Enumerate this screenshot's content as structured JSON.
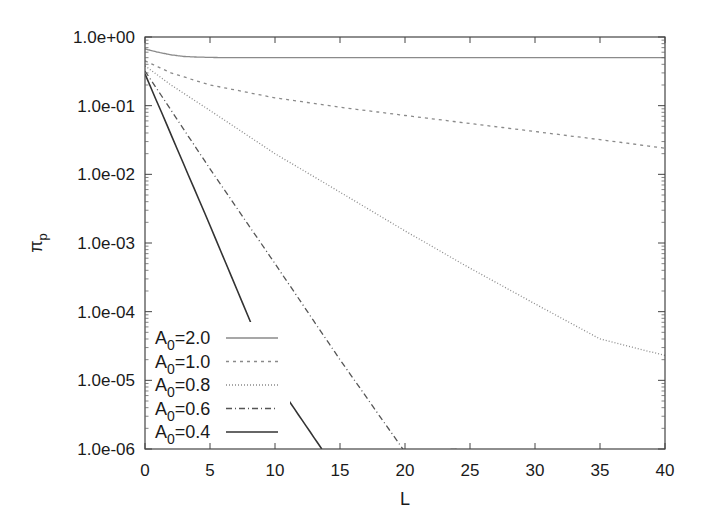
{
  "chart_data": {
    "type": "line",
    "title": "",
    "xlabel": "L",
    "ylabel": "π_p",
    "ylabel_main": "π",
    "ylabel_sub": "p",
    "xlim": [
      0,
      40
    ],
    "ylim": [
      1e-06,
      1.0
    ],
    "yscale": "log",
    "grid": false,
    "legend_position": "lower left",
    "x_ticks": [
      0,
      5,
      10,
      15,
      20,
      25,
      30,
      35,
      40
    ],
    "y_ticks": [
      "1.0e+00",
      "1.0e-01",
      "1.0e-02",
      "1.0e-03",
      "1.0e-04",
      "1.0e-05",
      "1.0e-06"
    ],
    "series": [
      {
        "name": "A0=2.0",
        "label_main": "A",
        "label_sub": "0",
        "label_val": "=2.0",
        "style": "solid",
        "color": "#8a8a8a",
        "x": [
          0,
          1,
          2,
          3,
          4,
          6,
          10,
          20,
          30,
          40
        ],
        "y": [
          0.67,
          0.6,
          0.55,
          0.52,
          0.51,
          0.5,
          0.5,
          0.5,
          0.5,
          0.5
        ]
      },
      {
        "name": "A0=1.0",
        "label_main": "A",
        "label_sub": "0",
        "label_val": "=1.0",
        "style": "dashed",
        "color": "#8a8a8a",
        "x": [
          0,
          2,
          5,
          10,
          15,
          20,
          25,
          30,
          35,
          40
        ],
        "y": [
          0.45,
          0.3,
          0.2,
          0.13,
          0.095,
          0.072,
          0.055,
          0.042,
          0.032,
          0.024
        ]
      },
      {
        "name": "A0=0.8",
        "label_main": "A",
        "label_sub": "0",
        "label_val": "=0.8",
        "style": "dotted",
        "color": "#8a8a8a",
        "x": [
          0,
          2,
          5,
          10,
          15,
          20,
          25,
          30,
          35,
          40
        ],
        "y": [
          0.38,
          0.2,
          0.085,
          0.02,
          0.0055,
          0.0015,
          0.00043,
          0.00013,
          4e-05,
          2.3e-05
        ]
      },
      {
        "name": "A0=0.6",
        "label_main": "A",
        "label_sub": "0",
        "label_val": "=0.6",
        "style": "dashdot",
        "color": "#555555",
        "x": [
          0,
          5,
          10,
          15,
          20,
          24.2
        ],
        "y": [
          0.32,
          0.012,
          0.0005,
          2e-05,
          9e-07,
          1e-06
        ]
      },
      {
        "name": "A0=0.4",
        "label_main": "A",
        "label_sub": "0",
        "label_val": "=0.4",
        "style": "solid",
        "color": "#333333",
        "x": [
          0,
          5,
          10,
          13.6
        ],
        "y": [
          0.29,
          0.0018,
          1e-05,
          1e-06
        ]
      }
    ]
  }
}
